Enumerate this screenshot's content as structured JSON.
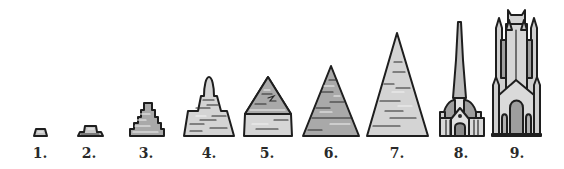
{
  "figure": {
    "stages": [
      {
        "label": "1.",
        "kind": "small-mound"
      },
      {
        "label": "2.",
        "kind": "stepped-platform"
      },
      {
        "label": "3.",
        "kind": "stepped-pyramid"
      },
      {
        "label": "4.",
        "kind": "stepped-stupa"
      },
      {
        "label": "5.",
        "kind": "bent-pyramid"
      },
      {
        "label": "6.",
        "kind": "pyramid"
      },
      {
        "label": "7.",
        "kind": "great-pyramid"
      },
      {
        "label": "8.",
        "kind": "spired-cathedral"
      },
      {
        "label": "9.",
        "kind": "gothic-tower-cathedral"
      }
    ],
    "colors": {
      "outline": "#1e1e1e",
      "light_stone": "#d6d6d6",
      "mid_stone": "#b4b4b4",
      "dark_stone": "#9a9a9a",
      "background": "#ffffff"
    }
  }
}
